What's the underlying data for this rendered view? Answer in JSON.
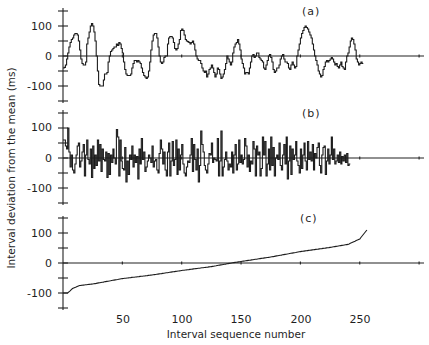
{
  "chart_data": {
    "type": "line",
    "title": "",
    "xlabel": "Interval sequence number",
    "ylabel": "Interval deviation from the mean (ms)",
    "x_ticks": [
      50,
      100,
      150,
      200,
      250
    ],
    "x_range": [
      0,
      300
    ],
    "y_ticks_labeled": [
      100,
      0,
      -100
    ],
    "y_ticks_minor": [
      150,
      50,
      -50,
      -150
    ],
    "y_range": [
      -150,
      150
    ],
    "grid": false,
    "legend": null,
    "panels": [
      {
        "label": "(a)",
        "description": "Interval deviations in sequence (smooth, step-like drifts)",
        "style": "step",
        "values": [
          -40,
          -38,
          -30,
          -10,
          10,
          30,
          45,
          55,
          60,
          70,
          75,
          75,
          70,
          50,
          20,
          -10,
          -25,
          -30,
          -30,
          -20,
          40,
          60,
          80,
          100,
          108,
          100,
          80,
          50,
          0,
          -50,
          -95,
          -100,
          -100,
          -100,
          -80,
          -60,
          -60,
          -55,
          -20,
          0,
          15,
          20,
          25,
          30,
          30,
          40,
          35,
          45,
          40,
          25,
          10,
          -20,
          -45,
          -60,
          -65,
          -65,
          -65,
          -60,
          -40,
          -25,
          -15,
          -15,
          -20,
          -15,
          -20,
          -25,
          -40,
          -55,
          -65,
          -70,
          -75,
          -70,
          -50,
          -20,
          20,
          50,
          70,
          75,
          75,
          60,
          30,
          0,
          -20,
          -25,
          -20,
          -5,
          0,
          0,
          40,
          60,
          65,
          65,
          60,
          45,
          25,
          20,
          25,
          40,
          55,
          85,
          90,
          85,
          70,
          55,
          50,
          48,
          45,
          40,
          45,
          50,
          40,
          20,
          0,
          -10,
          -15,
          -15,
          -25,
          -40,
          -50,
          -55,
          -50,
          -70,
          -60,
          -45,
          -40,
          -30,
          -40,
          -55,
          -70,
          -60,
          -40,
          -45,
          -60,
          -75,
          -70,
          -60,
          -45,
          -25,
          0,
          -10,
          -20,
          -30,
          -20,
          10,
          30,
          40,
          45,
          55,
          40,
          20,
          -10,
          -25,
          -40,
          -60,
          -55,
          -55,
          -60,
          -40,
          -20,
          0,
          5,
          -5,
          0,
          10,
          10,
          -5,
          -10,
          -15,
          -20,
          -40,
          -45,
          -30,
          -15,
          0,
          5,
          -5,
          -20,
          -45,
          -55,
          -50,
          -40,
          -40,
          -30,
          -10,
          0,
          5,
          -10,
          -20,
          -20,
          -25,
          -40,
          -45,
          -30,
          -20,
          -30,
          -40,
          -35,
          0,
          20,
          40,
          60,
          75,
          85,
          95,
          100,
          95,
          90,
          80,
          70,
          60,
          40,
          20,
          0,
          -15,
          -30,
          -50,
          -60,
          -70,
          -65,
          -45,
          -35,
          -20,
          -15,
          -20,
          -15,
          -10,
          -5,
          -10,
          -20,
          -30,
          -25,
          -35,
          -40,
          -30,
          -20,
          -35,
          -40,
          -45,
          -20,
          0,
          10,
          30,
          50,
          60,
          55,
          40,
          20,
          -10,
          -20,
          -30,
          -25,
          -20,
          -25
        ],
        "y_zero_pixel": 56
      },
      {
        "label": "(b)",
        "description": "Shuffled interval deviations (uncorrelated, rapidly alternating)",
        "style": "step",
        "values": [
          60,
          60,
          40,
          30,
          100,
          20,
          -30,
          10,
          -40,
          -50,
          -20,
          10,
          40,
          50,
          -30,
          -10,
          20,
          45,
          -60,
          10,
          60,
          -5,
          -20,
          30,
          -65,
          40,
          -35,
          10,
          -25,
          60,
          -10,
          45,
          -45,
          30,
          -5,
          -10,
          20,
          -65,
          15,
          -55,
          10,
          -15,
          30,
          0,
          -20,
          95,
          70,
          -60,
          60,
          -10,
          -35,
          -40,
          35,
          -80,
          -10,
          -55,
          10,
          -5,
          40,
          -30,
          10,
          -15,
          5,
          -70,
          30,
          -20,
          65,
          -5,
          20,
          -45,
          -30,
          -10,
          10,
          0,
          -15,
          40,
          -30,
          -10,
          -5,
          -40,
          -50,
          15,
          60,
          30,
          -20,
          20,
          -40,
          -60,
          20,
          50,
          -60,
          -10,
          55,
          -25,
          -5,
          60,
          -55,
          30,
          -40,
          10,
          45,
          -20,
          -50,
          -60,
          -30,
          -10,
          -15,
          10,
          65,
          -45,
          45,
          -5,
          -40,
          30,
          -80,
          -25,
          90,
          45,
          20,
          -25,
          -40,
          -50,
          -20,
          15,
          10,
          50,
          -15,
          0,
          -5,
          -10,
          65,
          -60,
          -10,
          90,
          -60,
          -30,
          -5,
          20,
          -10,
          -40,
          -20,
          -30,
          20,
          -50,
          10,
          45,
          -40,
          -20,
          60,
          -15,
          10,
          -20,
          -5,
          65,
          40,
          -30,
          10,
          -45,
          -10,
          -20,
          55,
          30,
          -60,
          40,
          10,
          20,
          -60,
          -35,
          70,
          10,
          55,
          -60,
          -20,
          30,
          -40,
          70,
          -25,
          35,
          -60,
          0,
          10,
          -5,
          50,
          -25,
          -40,
          10,
          45,
          -20,
          70,
          -70,
          -10,
          40,
          -55,
          30,
          -5,
          10,
          55,
          -10,
          -25,
          -50,
          30,
          -35,
          10,
          50,
          -10,
          -40,
          55,
          -5,
          20,
          -10,
          45,
          -40,
          15,
          0,
          35,
          50,
          -25,
          -50,
          10,
          35,
          40,
          -55,
          -10,
          30,
          -20,
          10,
          70,
          -5,
          30,
          -20,
          -10,
          10,
          -15,
          20,
          -20,
          5,
          -10,
          10,
          -15,
          15,
          -25,
          -20
        ],
        "y_zero_pixel": 158
      },
      {
        "label": "(c)",
        "description": "Interval deviations ranked in ascending order",
        "style": "line",
        "values_summary": {
          "n": 256,
          "min": -100,
          "max": 110,
          "zero_crossing_index": 142,
          "anchors": [
            [
              0,
              -100
            ],
            [
              4,
              -100
            ],
            [
              8,
              -85
            ],
            [
              14,
              -75
            ],
            [
              25,
              -70
            ],
            [
              50,
              -52
            ],
            [
              75,
              -40
            ],
            [
              100,
              -25
            ],
            [
              125,
              -12
            ],
            [
              142,
              0
            ],
            [
              150,
              5
            ],
            [
              175,
              20
            ],
            [
              200,
              38
            ],
            [
              225,
              52
            ],
            [
              240,
              62
            ],
            [
              250,
              80
            ],
            [
              256,
              110
            ]
          ]
        },
        "y_zero_pixel": 263
      }
    ],
    "panel_labels": [
      "(a)",
      "(b)",
      "(c)"
    ]
  },
  "axes": {
    "x_label": "Interval sequence number",
    "y_label": "Interval deviation from the mean (ms)",
    "x_tick_labels": [
      "50",
      "100",
      "150",
      "200",
      "250"
    ],
    "y_tick_labels": [
      "100",
      "0",
      "-100"
    ]
  }
}
